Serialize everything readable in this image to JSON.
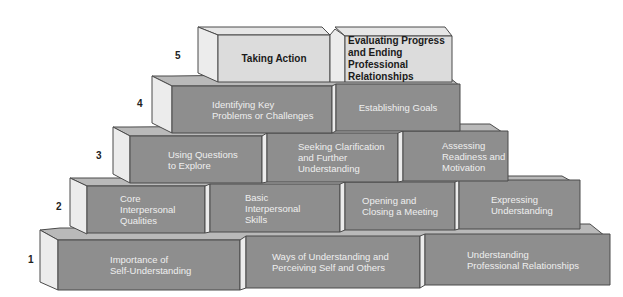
{
  "diagram": {
    "type": "pyramid-of-blocks",
    "colors": {
      "front_dark": "#8e8e8e",
      "front_light": "#dcdcdc",
      "side_face": "#ececec",
      "top_face": "#b9b9b9",
      "top_face_light": "#e6e6e6",
      "outline": "#4a4a4a",
      "text_on_dark": "#efefef",
      "text_on_light": "#1a1a1a"
    },
    "levels": [
      {
        "number": "5",
        "blocks": [
          {
            "label": "Taking Action",
            "style": "light"
          },
          {
            "label": "Evaluating Progress\nand Ending\nProfessional\nRelationships",
            "style": "light"
          }
        ]
      },
      {
        "number": "4",
        "blocks": [
          {
            "label": "Identifying Key\nProblems or Challenges",
            "style": "dark"
          },
          {
            "label": "Establishing Goals",
            "style": "dark"
          }
        ]
      },
      {
        "number": "3",
        "blocks": [
          {
            "label": "Using Questions\nto Explore",
            "style": "dark"
          },
          {
            "label": "Seeking Clarification\nand Further\nUnderstanding",
            "style": "dark"
          },
          {
            "label": "Assessing\nReadiness and\nMotivation",
            "style": "dark"
          }
        ]
      },
      {
        "number": "2",
        "blocks": [
          {
            "label": "Core\nInterpersonal\nQualities",
            "style": "dark"
          },
          {
            "label": "Basic\nInterpersonal\nSkills",
            "style": "dark"
          },
          {
            "label": "Opening and\nClosing a Meeting",
            "style": "dark"
          },
          {
            "label": "Expressing\nUnderstanding",
            "style": "dark"
          }
        ]
      },
      {
        "number": "1",
        "blocks": [
          {
            "label": "Importance of\nSelf-Understanding",
            "style": "dark"
          },
          {
            "label": "Ways of Understanding and\nPerceiving Self and Others",
            "style": "dark"
          },
          {
            "label": "Understanding\nProfessional Relationships",
            "style": "dark"
          }
        ]
      }
    ]
  }
}
